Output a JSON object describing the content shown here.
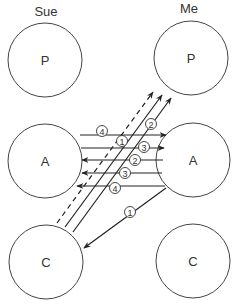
{
  "columns": {
    "left": "Sue",
    "right": "Me"
  },
  "states": {
    "sue_p": "P",
    "sue_a": "A",
    "sue_c": "C",
    "me_p": "P",
    "me_a": "A",
    "me_c": "C"
  },
  "transactions": {
    "t1": "4",
    "t2": "1",
    "t3": "2",
    "t4": "3",
    "t5": "2",
    "t6": "3",
    "t7": "4",
    "t8": "1"
  },
  "colors": {
    "stroke": "#222222",
    "circle": "#444444",
    "background": "#ffffff"
  }
}
